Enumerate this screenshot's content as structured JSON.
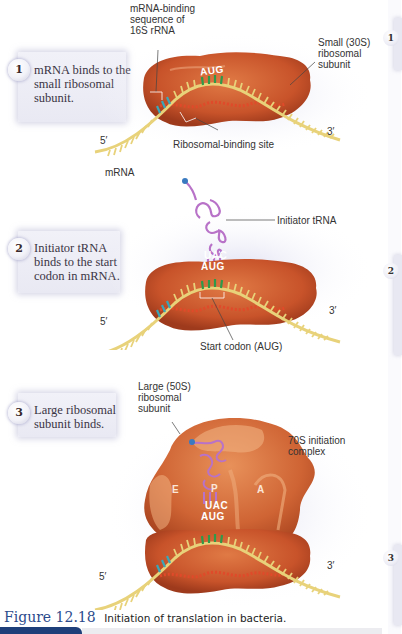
{
  "steps": [
    {
      "number": "1",
      "text_lines": [
        "mRNA binds to the",
        "small ribosomal",
        "subunit."
      ],
      "labels": {
        "binding_seq": [
          "mRNA-binding",
          "sequence of",
          "16S rRNA"
        ],
        "small_subunit": [
          "Small (30S)",
          "ribosomal",
          "subunit"
        ],
        "ribosomal_binding_site": "Ribosomal-binding site",
        "mrna": "mRNA",
        "five_prime": "5′",
        "three_prime": "3′",
        "codon": "AUG"
      }
    },
    {
      "number": "2",
      "text_lines": [
        "Initiator tRNA",
        "binds to the start",
        "codon in mRNA."
      ],
      "labels": {
        "initiator_trna": "Initiator tRNA",
        "start_codon": "Start codon (AUG)",
        "five_prime": "5′",
        "three_prime": "3′",
        "anticodon": "UAC",
        "codon": "AUG"
      }
    },
    {
      "number": "3",
      "text_lines": [
        "Large ribosomal",
        "subunit binds."
      ],
      "labels": {
        "large_subunit": [
          "Large (50S)",
          "ribosomal",
          "subunit"
        ],
        "initiation_complex": [
          "70S initiation",
          "complex"
        ],
        "site_e": "E",
        "site_p": "P",
        "site_a": "A",
        "five_prime": "5′",
        "three_prime": "3′",
        "anticodon": "UAC",
        "codon": "AUG"
      }
    }
  ],
  "right_edge_numbers": [
    "1",
    "2",
    "3"
  ],
  "caption": {
    "figure": "Figure 12.18",
    "text": "Initiation of translation in bacteria."
  },
  "colors": {
    "ribosome": "#c8532a",
    "ribosome_light": "#e08a5a",
    "mrna": "#e8d27a",
    "binding_site": "#3aa6b8",
    "start_codon": "#2f9a4a",
    "trna": "#b872c8",
    "figure_blue": "#2b4a8c"
  }
}
